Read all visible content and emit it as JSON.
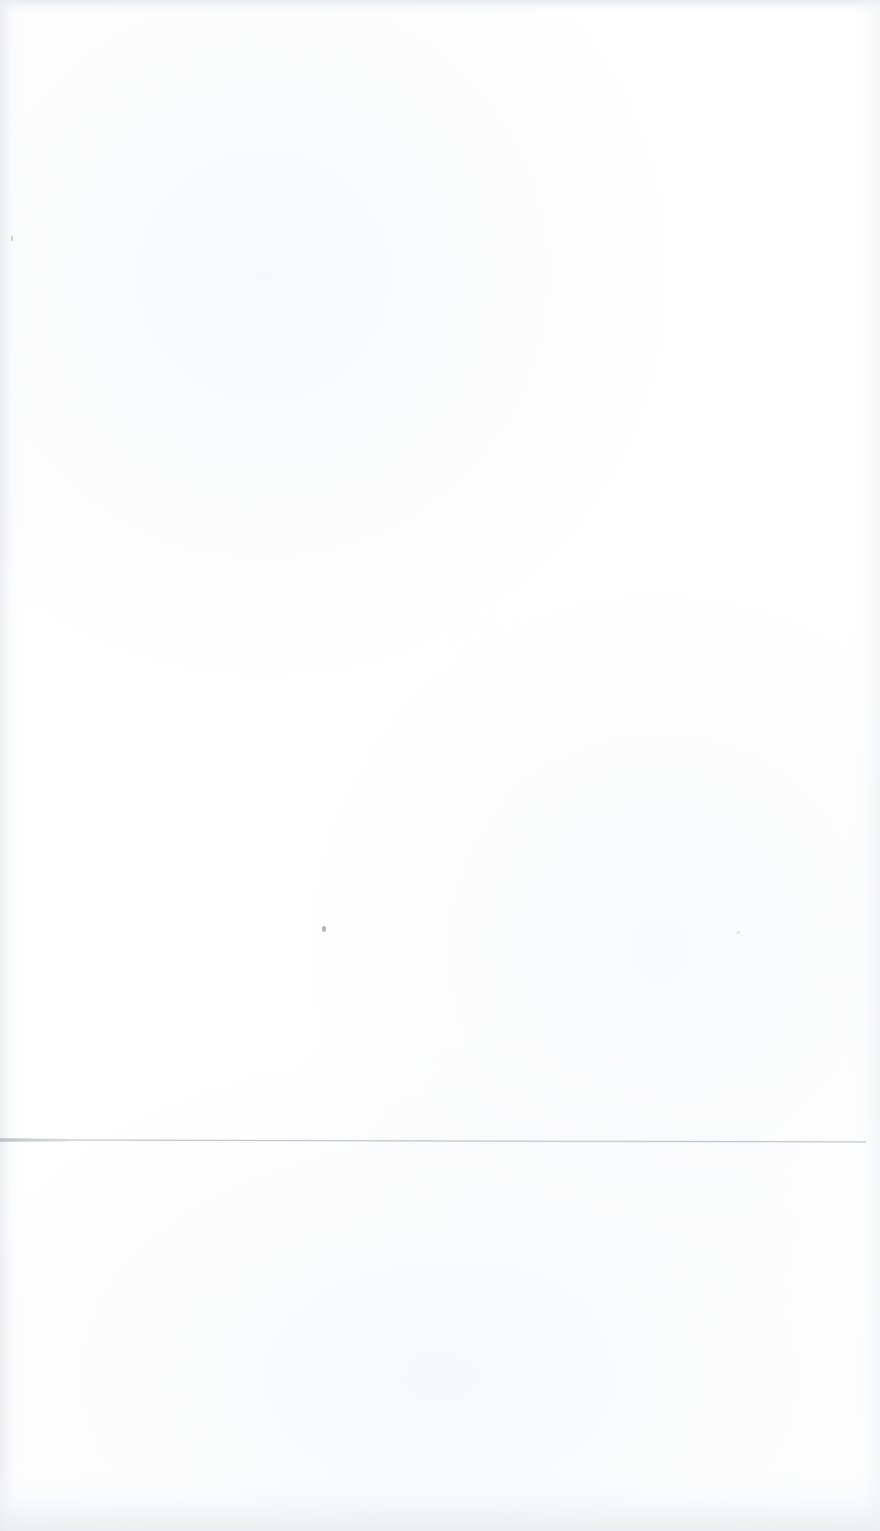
{
  "page": {
    "kind": "scanned-blank-page",
    "width": 880,
    "height": 1531,
    "background_color": "#ffffff",
    "body_text": "",
    "header_text": "",
    "footer_text": "",
    "page_number": ""
  },
  "marks": {
    "horizontal_rule": {
      "label": "",
      "color": "#bcc0c8",
      "left": 0,
      "top": 1139,
      "width": 866,
      "thickness": 2
    },
    "specks": [
      {
        "label": "",
        "color": "#969aa2"
      },
      {
        "label": "",
        "color": "#80848c"
      },
      {
        "label": "",
        "color": "#c6c9cf"
      }
    ]
  }
}
